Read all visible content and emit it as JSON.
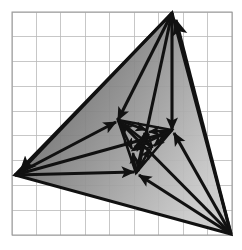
{
  "figure": {
    "background_color": "#ffffff",
    "stroke_color": "#111111",
    "grid": {
      "line_color": "#b9b9b9",
      "border_color": "#9a9a9a",
      "line_width": 0.8,
      "cell_size": 24.7,
      "x_start": 12,
      "y_start": 12,
      "x_end": 232,
      "y_end": 235,
      "columns": 9,
      "rows": 9
    },
    "fill": {
      "type": "linear-gradient",
      "angle_deg": 115,
      "stops": [
        {
          "offset": 0.0,
          "color": "#4f4f4f"
        },
        {
          "offset": 0.28,
          "color": "#6e6e6e"
        },
        {
          "offset": 0.52,
          "color": "#8c8c8c"
        },
        {
          "offset": 0.72,
          "color": "#a6a6a6"
        },
        {
          "offset": 0.9,
          "color": "#bdbdbd"
        },
        {
          "offset": 1.0,
          "color": "#c9c9c9"
        }
      ],
      "opacity": 0.93
    }
  },
  "chart_data": {
    "type": "scatter",
    "xlabel": "",
    "ylabel": "",
    "xlim": [
      0,
      242
    ],
    "ylim": [
      250,
      0
    ],
    "grid": true,
    "legend": "none",
    "annotations": [],
    "levels": [
      {
        "name": "outer-triangle",
        "level": 0,
        "vertices": [
          {
            "id": "A0",
            "x": 172,
            "y": 13
          },
          {
            "id": "B0",
            "x": 15,
            "y": 175
          },
          {
            "id": "C0",
            "x": 231,
            "y": 234
          }
        ]
      },
      {
        "name": "middle-triangle",
        "level": 1,
        "vertices": [
          {
            "id": "A1",
            "x": 118,
            "y": 120
          },
          {
            "id": "B1",
            "x": 172,
            "y": 130
          },
          {
            "id": "C1",
            "x": 136,
            "y": 173
          }
        ]
      },
      {
        "name": "inner-triangle",
        "level": 2,
        "vertices": [
          {
            "id": "A2",
            "x": 147,
            "y": 131
          },
          {
            "id": "B2",
            "x": 152,
            "y": 147
          },
          {
            "id": "C2",
            "x": 133,
            "y": 150
          }
        ]
      }
    ],
    "fixed_point": {
      "id": "P",
      "x": 144,
      "y": 143
    },
    "arrows": [
      {
        "id": "a1",
        "from": "A0",
        "to": "A1",
        "x1": 172,
        "y1": 13,
        "x2": 118,
        "y2": 120
      },
      {
        "id": "a2",
        "from": "A0",
        "to": "B1",
        "x1": 172,
        "y1": 13,
        "x2": 172,
        "y2": 130
      },
      {
        "id": "a3",
        "from": "A0",
        "to": "C1",
        "x1": 172,
        "y1": 13,
        "x2": 138,
        "y2": 171
      },
      {
        "id": "a4",
        "from": "A0",
        "to": "B0",
        "x1": 172,
        "y1": 13,
        "x2": 20,
        "y2": 172
      },
      {
        "id": "a5",
        "from": "B0",
        "to": "A1",
        "x1": 15,
        "y1": 175,
        "x2": 116,
        "y2": 122
      },
      {
        "id": "a6",
        "from": "B0",
        "to": "B1",
        "x1": 15,
        "y1": 175,
        "x2": 170,
        "y2": 132
      },
      {
        "id": "a7",
        "from": "B0",
        "to": "C1",
        "x1": 15,
        "y1": 175,
        "x2": 134,
        "y2": 172
      },
      {
        "id": "a8",
        "from": "C0",
        "to": "A1",
        "x1": 231,
        "y1": 234,
        "x2": 120,
        "y2": 122
      },
      {
        "id": "a9",
        "from": "C0",
        "to": "B1",
        "x1": 231,
        "y1": 234,
        "x2": 174,
        "y2": 133
      },
      {
        "id": "a10",
        "from": "C0",
        "to": "C1",
        "x1": 231,
        "y1": 234,
        "x2": 139,
        "y2": 175
      },
      {
        "id": "a11",
        "from": "C0",
        "to": "A0",
        "x1": 231,
        "y1": 234,
        "x2": 176,
        "y2": 20
      },
      {
        "id": "a12",
        "from": "A1",
        "to": "A2",
        "x1": 118,
        "y1": 120,
        "x2": 146,
        "y2": 130
      },
      {
        "id": "a13",
        "from": "A1",
        "to": "B2",
        "x1": 118,
        "y1": 120,
        "x2": 151,
        "y2": 146
      },
      {
        "id": "a14",
        "from": "A1",
        "to": "C2",
        "x1": 118,
        "y1": 120,
        "x2": 132,
        "y2": 149
      },
      {
        "id": "a15",
        "from": "B1",
        "to": "A2",
        "x1": 172,
        "y1": 130,
        "x2": 149,
        "y2": 132
      },
      {
        "id": "a16",
        "from": "B1",
        "to": "B2",
        "x1": 172,
        "y1": 130,
        "x2": 154,
        "y2": 146
      },
      {
        "id": "a17",
        "from": "B1",
        "to": "C2",
        "x1": 172,
        "y1": 130,
        "x2": 135,
        "y2": 148
      },
      {
        "id": "a18",
        "from": "C1",
        "to": "A2",
        "x1": 136,
        "y1": 173,
        "x2": 145,
        "y2": 134
      },
      {
        "id": "a19",
        "from": "C1",
        "to": "B2",
        "x1": 136,
        "y1": 173,
        "x2": 150,
        "y2": 149
      },
      {
        "id": "a20",
        "from": "C1",
        "to": "C2",
        "x1": 136,
        "y1": 173,
        "x2": 133,
        "y2": 153
      },
      {
        "id": "a21",
        "from": "A2",
        "to": "P",
        "x1": 147,
        "y1": 131,
        "x2": 145,
        "y2": 141
      },
      {
        "id": "a22",
        "from": "B2",
        "to": "P",
        "x1": 152,
        "y1": 147,
        "x2": 147,
        "y2": 144
      },
      {
        "id": "a23",
        "from": "C2",
        "to": "P",
        "x1": 133,
        "y1": 150,
        "x2": 142,
        "y2": 145
      }
    ]
  }
}
